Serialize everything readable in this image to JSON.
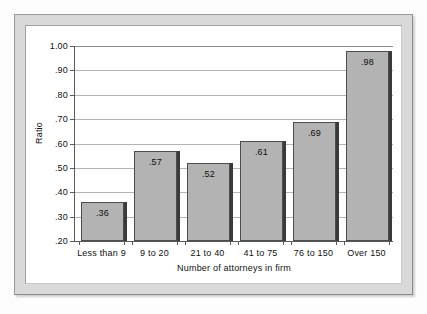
{
  "chart_data": {
    "type": "bar",
    "title": "",
    "subtitle": "",
    "xlabel": "Number of attorneys in firm",
    "ylabel": "Ratio",
    "categories": [
      "Less than 9",
      "9 to 20",
      "21 to 40",
      "41 to 75",
      "76 to 150",
      "Over 150"
    ],
    "values": [
      0.36,
      0.57,
      0.52,
      0.61,
      0.69,
      0.98
    ],
    "value_labels": [
      ".36",
      ".57",
      ".52",
      ".61",
      ".69",
      ".98"
    ],
    "ylim": [
      0.2,
      1.0
    ],
    "ytick_values": [
      1.0,
      0.9,
      0.8,
      0.7,
      0.6,
      0.5,
      0.4,
      0.3,
      0.2
    ],
    "ytick_labels": [
      "1.00",
      ".90",
      ".80",
      ".70",
      ".60",
      ".50",
      ".40",
      ".30",
      ".20"
    ],
    "grid": true,
    "legend": "none",
    "bar_color": "#b3b3b3",
    "bar_edge_color": "#4d4d4d",
    "bar_shadow_color": "#3a3a3a",
    "gridline_color": "#b4b4b4",
    "axis_color": "#5a5a5a",
    "plot_background": "#ffffff",
    "frame_color": "#d9d9d9",
    "page_background": "#fdfdfd"
  }
}
